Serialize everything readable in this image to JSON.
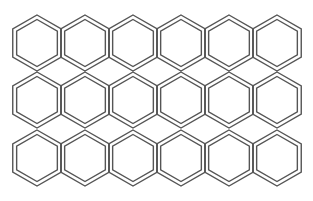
{
  "grid": {
    "rows": 3,
    "cols": 6,
    "start_x": 37,
    "col_spacing": 48,
    "row_centers": [
      43,
      100,
      158
    ],
    "outer_radius": 28,
    "inner_radius": 23.5,
    "stroke_color": "#555555",
    "background": "#ffffff",
    "shape": "double-outline hexagon (pointy-top)"
  }
}
